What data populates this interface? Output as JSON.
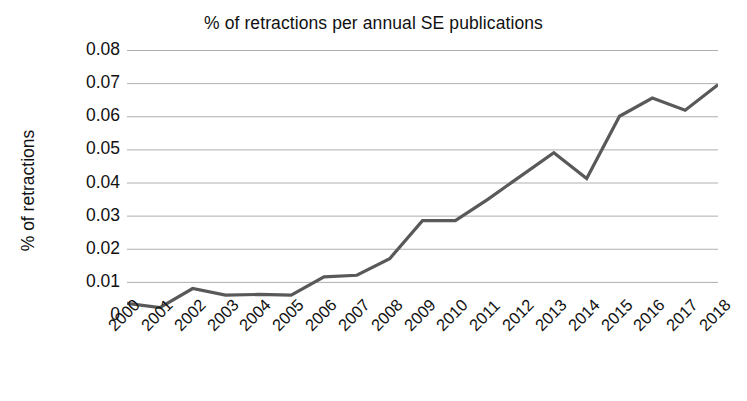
{
  "chart_data": {
    "type": "line",
    "title": "% of retractions per annual SE publications",
    "xlabel": "",
    "ylabel": "% of retractions",
    "grid": true,
    "legend": "none",
    "xlim": [
      "2000",
      "2018"
    ],
    "ylim": [
      0,
      0.08
    ],
    "ytick_labels": [
      "0.08",
      "0.07",
      "0.06",
      "0.05",
      "0.04",
      "0.03",
      "0.02",
      "0.01",
      "0"
    ],
    "ytick_values": [
      0.08,
      0.07,
      0.06,
      0.05,
      0.04,
      0.03,
      0.02,
      0.01,
      0
    ],
    "categories": [
      "2000",
      "2001",
      "2002",
      "2003",
      "2004",
      "2005",
      "2006",
      "2007",
      "2008",
      "2009",
      "2010",
      "2011",
      "2012",
      "2013",
      "2014",
      "2015",
      "2016",
      "2017",
      "2018"
    ],
    "values": [
      0.0035,
      0.0022,
      0.008,
      0.006,
      0.0062,
      0.006,
      0.0115,
      0.012,
      0.017,
      0.0285,
      0.0285,
      0.035,
      0.042,
      0.049,
      0.0412,
      0.06,
      0.0655,
      0.0618,
      0.0695
    ],
    "series_color": "#595959",
    "grid_color": "#a6a6a6",
    "axis_color": "#a6a6a6",
    "text_color": "#111111",
    "background": "#ffffff",
    "line_width": 3.2
  }
}
